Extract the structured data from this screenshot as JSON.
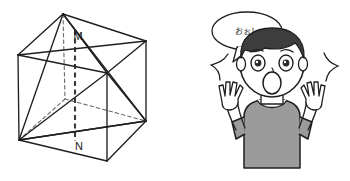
{
  "image": {
    "width": 350,
    "height": 181,
    "background": "#ffffff",
    "description": "Two-part illustration: a geometry cube diagram on the left and a surprised cartoon boy on the right"
  },
  "cube_diagram": {
    "name": "cube-with-inscribed-tetrahedron",
    "labels": [
      {
        "text": "M",
        "x": 82,
        "y": 36
      },
      {
        "text": "N",
        "x": 82,
        "y": 146
      }
    ],
    "stroke_solid": "#1f1f1f",
    "stroke_dashed": "#5a5a5a",
    "fill": "none",
    "vertices": {
      "back_top_left": {
        "x": 18,
        "y": 55
      },
      "top_apex": {
        "x": 63,
        "y": 14
      },
      "top_right": {
        "x": 146,
        "y": 41
      },
      "front_top_right": {
        "x": 107,
        "y": 73
      },
      "bottom_left": {
        "x": 19,
        "y": 140
      },
      "bottom_center": {
        "x": 65,
        "y": 99
      },
      "bottom_right": {
        "x": 146,
        "y": 121
      },
      "front_bottom": {
        "x": 107,
        "y": 161
      }
    },
    "segment_count": 18
  },
  "character": {
    "name": "surprised-boy",
    "expression": "shocked",
    "hair_color": "#3d3d3d",
    "skin_color": "#ffffff",
    "shirt_color": "#9b9b9b",
    "outline_color": "#1f1f1f",
    "pose": "both hands raised, mouth open",
    "motion_lines": 2
  },
  "speech_bubble": {
    "name": "speech-bubble",
    "text": "おぉ！",
    "fill": "#ffffff",
    "stroke": "#1f1f1f",
    "center_x": 247,
    "center_y": 31
  }
}
